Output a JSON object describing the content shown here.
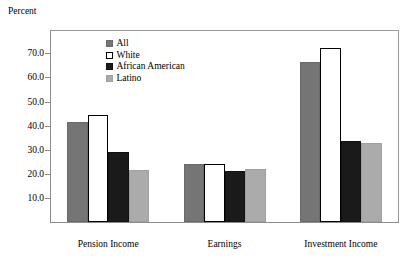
{
  "chart_data": {
    "type": "bar",
    "title": "",
    "xlabel": "",
    "ylabel": "Percent",
    "ylim": [
      0,
      76
    ],
    "grid": false,
    "legend_position": "inside-top-left",
    "categories": [
      "Pension Income",
      "Earnings",
      "Investment Income"
    ],
    "ytick_labels": [
      "10.0",
      "20.0",
      "30.0",
      "40.0",
      "50.0",
      "60.0",
      "70.0"
    ],
    "ytick_values": [
      10,
      20,
      30,
      40,
      50,
      60,
      70
    ],
    "series": [
      {
        "name": "All",
        "color": "#757575",
        "values": [
          41.5,
          24.0,
          66.5
        ]
      },
      {
        "name": "White",
        "color": "#ffffff",
        "values": [
          44.5,
          24.0,
          72.0
        ]
      },
      {
        "name": "African American",
        "color": "#1a1a1a",
        "values": [
          29.0,
          21.2,
          33.8
        ]
      },
      {
        "name": "Latino",
        "color": "#ababab",
        "values": [
          21.5,
          22.0,
          32.7
        ]
      }
    ]
  },
  "axis": {
    "y_title": "Percent"
  },
  "legend": {
    "items": [
      {
        "label": "All",
        "swatch": "s-all"
      },
      {
        "label": "White",
        "swatch": "s-white"
      },
      {
        "label": "African American",
        "swatch": "s-aa"
      },
      {
        "label": "Latino",
        "swatch": "s-latino"
      }
    ]
  }
}
